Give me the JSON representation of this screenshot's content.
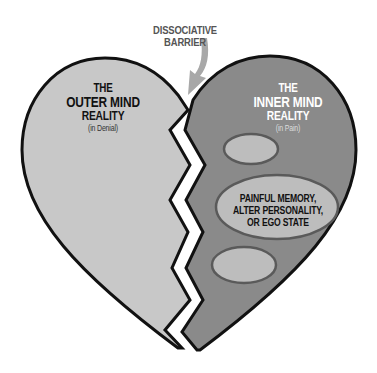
{
  "diagram": {
    "barrier_label": {
      "line1": "DISSOCIATIVE",
      "line2": "BARRIER"
    },
    "left_half": {
      "line1": "THE",
      "line2": "OUTER MIND",
      "line3": "REALITY",
      "subtitle": "(in Denial)",
      "fill": "#c8c8c8"
    },
    "right_half": {
      "line1": "THE",
      "line2": "INNER MIND",
      "line3": "REALITY",
      "subtitle": "(in Pain)",
      "fill": "#8a8a8a"
    },
    "ellipses": [
      {
        "id": "top-small",
        "label": ""
      },
      {
        "id": "middle-large",
        "line1": "PAINFUL MEMORY,",
        "line2": "ALTER PERSONALITY,",
        "line3": "OR EGO STATE"
      },
      {
        "id": "bottom-small",
        "label": ""
      }
    ],
    "colors": {
      "outline": "#111111",
      "ellipse_fill": "#bdbdbd",
      "ellipse_stroke": "#5a5a5a",
      "arrow": "#a8a8a8",
      "barrier_gap": "#ffffff"
    }
  }
}
